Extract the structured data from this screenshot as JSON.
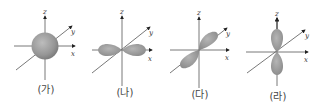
{
  "colors": {
    "orbital": "#9a9a9a",
    "axis": "#333333",
    "background": "#ffffff"
  },
  "panels": [
    {
      "label": "(가)",
      "orbital": "s",
      "axes": [
        "x",
        "y",
        "z"
      ]
    },
    {
      "label": "(나)",
      "orbital": "p_x",
      "axes": [
        "x",
        "y",
        "z"
      ]
    },
    {
      "label": "(다)",
      "orbital": "p_y",
      "axes": [
        "x",
        "y",
        "z"
      ]
    },
    {
      "label": "(라)",
      "orbital": "p_z",
      "axes": [
        "x",
        "y",
        "z"
      ]
    }
  ]
}
